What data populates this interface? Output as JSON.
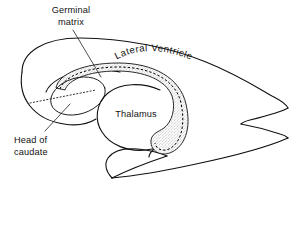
{
  "figure": {
    "kind": "anatomical-line-drawing",
    "background_color": "#ffffff",
    "ink_color": "#111111",
    "stipple_color": "#8a8a8a",
    "width": 296,
    "height": 231
  },
  "labels": {
    "germinal_matrix": {
      "line1": "Germinal",
      "line2": "matrix",
      "align": "center"
    },
    "lateral_ventricle": {
      "text": "Lateral Ventricle",
      "style": "curved"
    },
    "thalamus": {
      "text": "Thalamus",
      "align": "center"
    },
    "head_of_caudate": {
      "line1": "Head of",
      "line2": "caudate",
      "align": "left"
    }
  },
  "structures": [
    {
      "name": "lateral-ventricle-outline",
      "type": "outline"
    },
    {
      "name": "frontal-horn-outline",
      "type": "outline"
    },
    {
      "name": "occipital-horn-tip",
      "type": "outline"
    },
    {
      "name": "temporal-horn-outline",
      "type": "outline"
    },
    {
      "name": "thalamus-outline",
      "type": "outline"
    },
    {
      "name": "germinal-matrix-band",
      "type": "stippled-band"
    },
    {
      "name": "head-of-caudate-oval",
      "type": "outline"
    },
    {
      "name": "caudate-dashed-axis",
      "type": "dashed-line"
    }
  ],
  "leader_lines": [
    {
      "name": "germinal-matrix-leader",
      "from": "Germinal matrix",
      "to": "germinal-matrix-band"
    },
    {
      "name": "head-of-caudate-leader",
      "from": "Head of caudate",
      "to": "head-of-caudate-oval"
    }
  ]
}
